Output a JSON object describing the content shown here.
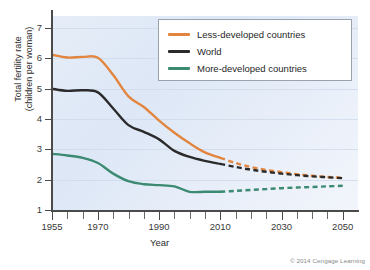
{
  "chart_data": {
    "type": "line",
    "title": "",
    "xlabel": "Year",
    "ylabel": "Total fertility rate\n(children per woman)",
    "xlim": [
      1955,
      2055
    ],
    "ylim": [
      1,
      7.4
    ],
    "grid": "horizontal",
    "legend_position": "top-right",
    "x_ticks_labeled": [
      "1955",
      "1970",
      "1990",
      "2010",
      "2030",
      "2050"
    ],
    "x_tick_values": [
      1955,
      1960,
      1965,
      1970,
      1975,
      1980,
      1985,
      1990,
      1995,
      2000,
      2005,
      2010,
      2015,
      2020,
      2025,
      2030,
      2035,
      2040,
      2045,
      2050
    ],
    "y_ticks": [
      "1",
      "2",
      "3",
      "4",
      "5",
      "6",
      "7"
    ],
    "y_tick_values": [
      1,
      2,
      3,
      4,
      5,
      6,
      7
    ],
    "projection_start_year": 2010,
    "projection_note": "Dashed segments are projections",
    "x": [
      1955,
      1960,
      1965,
      1970,
      1975,
      1980,
      1985,
      1990,
      1995,
      2000,
      2005,
      2010,
      2015,
      2020,
      2025,
      2030,
      2035,
      2040,
      2045,
      2050
    ],
    "series": [
      {
        "name": "Less-developed countries",
        "color": "#E2853F",
        "values": [
          6.12,
          6.03,
          6.05,
          6.02,
          5.45,
          4.75,
          4.4,
          3.95,
          3.55,
          3.2,
          2.9,
          2.72,
          2.55,
          2.42,
          2.32,
          2.25,
          2.18,
          2.13,
          2.09,
          2.06
        ]
      },
      {
        "name": "World",
        "color": "#2B2B2B",
        "values": [
          5.0,
          4.93,
          4.95,
          4.88,
          4.35,
          3.8,
          3.58,
          3.33,
          2.95,
          2.75,
          2.62,
          2.52,
          2.42,
          2.33,
          2.26,
          2.2,
          2.15,
          2.11,
          2.08,
          2.05
        ]
      },
      {
        "name": "More-developed countries",
        "color": "#3C8A72",
        "values": [
          2.85,
          2.8,
          2.72,
          2.55,
          2.2,
          1.95,
          1.85,
          1.82,
          1.78,
          1.6,
          1.6,
          1.6,
          1.63,
          1.66,
          1.69,
          1.72,
          1.74,
          1.76,
          1.78,
          1.8
        ]
      }
    ]
  },
  "axes": {
    "x_title": "Year",
    "y_title_line1": "Total fertility rate",
    "y_title_line2": "(children per woman)"
  },
  "legend": {
    "items": [
      {
        "label": "Less-developed countries",
        "color": "#E2853F"
      },
      {
        "label": "World",
        "color": "#2B2B2B"
      },
      {
        "label": "More-developed countries",
        "color": "#3C8A72"
      }
    ]
  },
  "footer": {
    "copyright": "© 2014 Cengage Learning"
  }
}
